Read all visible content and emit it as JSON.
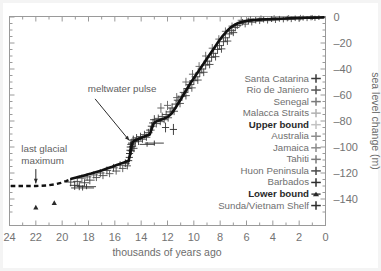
{
  "chart_data": {
    "type": "scatter",
    "title": "",
    "subtitle": "",
    "xlabel": "thousands of years ago",
    "ylabel": "sea level change (m)",
    "xlim": [
      24,
      0
    ],
    "ylim": [
      -150,
      4
    ],
    "x_ticks": [
      24,
      22,
      20,
      18,
      16,
      14,
      12,
      10,
      8,
      6,
      4,
      2,
      0
    ],
    "x_tick_labels": [
      "24",
      "22",
      "20",
      "18",
      "16",
      "14",
      "12",
      "10",
      "8",
      "6",
      "4",
      "2",
      "0"
    ],
    "x_minor_step": 1,
    "y_ticks": [
      0,
      -20,
      -40,
      -60,
      -80,
      -100,
      -120,
      -140
    ],
    "y_tick_labels": [
      "0",
      "-20",
      "-40",
      "-60",
      "-80",
      "-100",
      "-120",
      "-140"
    ],
    "y_minor_step": 5,
    "grid": false,
    "legend_position": "center-right",
    "legend": [
      {
        "label": "Santa Catarina",
        "marker": "plus",
        "color": "#3a3a3a",
        "bold": false
      },
      {
        "label": "Rio de Janiero",
        "marker": "plus",
        "color": "#555555",
        "bold": false
      },
      {
        "label": "Senegal",
        "marker": "plus",
        "color": "#7a7a7a",
        "bold": false
      },
      {
        "label": "Malacca Straits",
        "marker": "plus",
        "color": "#b0b0b0",
        "bold": false
      },
      {
        "label": "Upper bound",
        "marker": "plus",
        "color": "#c2c2c2",
        "bold": true
      },
      {
        "label": "Australia",
        "marker": "plus",
        "color": "#8c8c8c",
        "bold": false
      },
      {
        "label": "Jamaica",
        "marker": "plus",
        "color": "#8c8c8c",
        "bold": false
      },
      {
        "label": "Tahiti",
        "marker": "plus",
        "color": "#7a7a7a",
        "bold": false
      },
      {
        "label": "Huon Peninsula",
        "marker": "plus",
        "color": "#4a4a4a",
        "bold": false
      },
      {
        "label": "Barbados",
        "marker": "plus",
        "color": "#2e2e2e",
        "bold": false
      },
      {
        "label": "Lower bound",
        "marker": "triangle",
        "color": "#2a2a2a",
        "bold": true
      },
      {
        "label": "Sunda/Vietnam Shelf",
        "marker": "plus",
        "color": "#2e2e2e",
        "bold": false
      }
    ],
    "annotations": [
      {
        "text": "meltwater pulse",
        "text_x": 18.05,
        "text_y": -58,
        "anchor": "start",
        "arrow_from_x": 17.5,
        "arrow_from_y": -63,
        "arrow_to_x": 14.9,
        "arrow_to_y": -95
      },
      {
        "text_lines": [
          "last glacial",
          "maximum"
        ],
        "text_x": 23.1,
        "text_y": -104,
        "anchor": "start",
        "arrow_from_x": 22.0,
        "arrow_from_y": -117,
        "arrow_to_x": 22.0,
        "arrow_to_y": -128
      }
    ],
    "series": [
      {
        "name": "Mean sea level curve (solid)",
        "style": "solid-line",
        "points": [
          [
            19.3,
            -124.5
          ],
          [
            19.0,
            -123.6
          ],
          [
            18.6,
            -122.6
          ],
          [
            18.2,
            -121.5
          ],
          [
            17.8,
            -120.4
          ],
          [
            17.4,
            -119.2
          ],
          [
            17.0,
            -118.0
          ],
          [
            16.6,
            -116.6
          ],
          [
            16.2,
            -115.2
          ],
          [
            15.8,
            -113.6
          ],
          [
            15.4,
            -112.2
          ],
          [
            15.1,
            -111.2
          ],
          [
            14.95,
            -110.6
          ],
          [
            14.85,
            -106.0
          ],
          [
            14.75,
            -100.0
          ],
          [
            14.65,
            -96.5
          ],
          [
            14.5,
            -95.0
          ],
          [
            14.2,
            -93.8
          ],
          [
            13.9,
            -92.5
          ],
          [
            13.6,
            -91.3
          ],
          [
            13.35,
            -90.4
          ],
          [
            13.2,
            -86.0
          ],
          [
            13.05,
            -82.0
          ],
          [
            12.9,
            -80.5
          ],
          [
            12.6,
            -79.4
          ],
          [
            12.3,
            -78.3
          ],
          [
            12.0,
            -77.0
          ],
          [
            11.7,
            -74.5
          ],
          [
            11.4,
            -70.0
          ],
          [
            11.1,
            -65.0
          ],
          [
            10.8,
            -60.0
          ],
          [
            10.5,
            -55.0
          ],
          [
            10.2,
            -50.0
          ],
          [
            9.9,
            -45.5
          ],
          [
            9.6,
            -41.0
          ],
          [
            9.3,
            -36.5
          ],
          [
            9.0,
            -32.0
          ],
          [
            8.7,
            -27.5
          ],
          [
            8.4,
            -23.0
          ],
          [
            8.1,
            -18.5
          ],
          [
            7.8,
            -14.5
          ],
          [
            7.5,
            -11.0
          ],
          [
            7.2,
            -8.0
          ],
          [
            6.9,
            -6.0
          ],
          [
            6.6,
            -4.6
          ],
          [
            6.3,
            -3.6
          ],
          [
            6.0,
            -3.0
          ],
          [
            5.5,
            -2.4
          ],
          [
            5.0,
            -2.0
          ],
          [
            4.5,
            -1.7
          ],
          [
            4.0,
            -1.5
          ],
          [
            3.5,
            -1.3
          ],
          [
            3.0,
            -1.1
          ],
          [
            2.5,
            -0.9
          ],
          [
            2.0,
            -0.8
          ],
          [
            1.5,
            -0.6
          ],
          [
            1.0,
            -0.5
          ],
          [
            0.5,
            -0.4
          ],
          [
            0.15,
            -0.3
          ]
        ]
      },
      {
        "name": "Inferred LGM plateau (dashed)",
        "style": "dashed-line",
        "points": [
          [
            23.9,
            -130.0
          ],
          [
            23.0,
            -130.0
          ],
          [
            22.0,
            -130.0
          ],
          [
            21.2,
            -129.6
          ],
          [
            20.6,
            -128.8
          ],
          [
            20.1,
            -127.6
          ],
          [
            19.7,
            -126.2
          ],
          [
            19.3,
            -124.5
          ]
        ]
      }
    ],
    "scatter_groups": [
      {
        "name": "dense-core-samples",
        "marker": "plus-errorbar",
        "note": "coral and shelf core sea-level index points with horizontal and vertical error bars"
      }
    ],
    "data_points": [
      [
        19.35,
        -127.0,
        0.45,
        4.0,
        "#3a3a3a"
      ],
      [
        19.05,
        -129.5,
        0.5,
        4.5,
        "#2e2e2e"
      ],
      [
        18.85,
        -126.5,
        0.4,
        3.5,
        "#444444"
      ],
      [
        18.7,
        -130.0,
        0.55,
        4.0,
        "#2e2e2e"
      ],
      [
        18.5,
        -124.0,
        0.35,
        3.5,
        "#555555"
      ],
      [
        18.3,
        -127.5,
        0.45,
        3.0,
        "#3a3a3a"
      ],
      [
        18.1,
        -123.0,
        0.4,
        3.5,
        "#4a4a4a"
      ],
      [
        17.9,
        -125.5,
        0.5,
        4.0,
        "#3a3a3a"
      ],
      [
        17.6,
        -121.5,
        0.4,
        3.2,
        "#555555"
      ],
      [
        17.4,
        -123.5,
        0.35,
        3.0,
        "#4a4a4a"
      ],
      [
        17.1,
        -120.0,
        0.4,
        3.5,
        "#3f3f3f"
      ],
      [
        16.9,
        -122.0,
        0.45,
        3.0,
        "#4a4a4a"
      ],
      [
        16.6,
        -118.0,
        0.4,
        3.5,
        "#3a3a3a"
      ],
      [
        16.4,
        -120.5,
        0.35,
        3.0,
        "#555555"
      ],
      [
        16.1,
        -116.0,
        0.4,
        3.5,
        "#3f3f3f"
      ],
      [
        15.9,
        -118.5,
        0.4,
        3.0,
        "#4a4a4a"
      ],
      [
        15.6,
        -114.0,
        0.4,
        3.5,
        "#3a3a3a"
      ],
      [
        15.4,
        -116.5,
        0.35,
        3.2,
        "#4f4f4f"
      ],
      [
        15.2,
        -112.5,
        0.4,
        3.5,
        "#333333"
      ],
      [
        15.05,
        -114.5,
        0.3,
        3.0,
        "#3a3a3a"
      ],
      [
        14.95,
        -110.5,
        0.3,
        4.0,
        "#222222"
      ],
      [
        14.9,
        -108.0,
        0.3,
        4.5,
        "#222222"
      ],
      [
        14.88,
        -105.0,
        0.3,
        4.0,
        "#262626"
      ],
      [
        14.85,
        -102.5,
        0.3,
        4.5,
        "#222222"
      ],
      [
        14.8,
        -100.0,
        0.35,
        5.0,
        "#1f1f1f"
      ],
      [
        14.78,
        -98.0,
        0.3,
        4.0,
        "#262626"
      ],
      [
        14.75,
        -103.0,
        0.3,
        4.0,
        "#2a2a2a"
      ],
      [
        14.7,
        -97.0,
        0.35,
        4.5,
        "#222222"
      ],
      [
        14.65,
        -99.5,
        0.3,
        4.0,
        "#2e2e2e"
      ],
      [
        14.6,
        -94.5,
        0.35,
        4.0,
        "#2a2a2a"
      ],
      [
        14.55,
        -101.0,
        0.3,
        3.5,
        "#333333"
      ],
      [
        14.45,
        -96.0,
        0.35,
        4.0,
        "#2e2e2e"
      ],
      [
        14.35,
        -93.0,
        0.4,
        3.5,
        "#3a3a3a"
      ],
      [
        14.2,
        -95.5,
        0.35,
        3.5,
        "#333333"
      ],
      [
        14.05,
        -92.0,
        0.4,
        3.5,
        "#3f3f3f"
      ],
      [
        13.9,
        -94.0,
        0.35,
        3.0,
        "#3a3a3a"
      ],
      [
        13.75,
        -90.5,
        0.4,
        3.5,
        "#444444"
      ],
      [
        13.6,
        -92.5,
        0.35,
        3.0,
        "#3f3f3f"
      ],
      [
        13.45,
        -89.0,
        0.4,
        3.5,
        "#3a3a3a"
      ],
      [
        13.3,
        -87.0,
        0.4,
        4.0,
        "#333333"
      ],
      [
        13.2,
        -84.0,
        0.35,
        4.0,
        "#2e2e2e"
      ],
      [
        13.1,
        -81.5,
        0.35,
        4.0,
        "#333333"
      ],
      [
        13.0,
        -79.0,
        0.4,
        4.5,
        "#2e2e2e"
      ],
      [
        12.85,
        -82.0,
        0.4,
        3.5,
        "#3a3a3a"
      ],
      [
        12.7,
        -78.0,
        0.4,
        3.5,
        "#444444"
      ],
      [
        12.55,
        -80.5,
        0.35,
        3.0,
        "#3f3f3f"
      ],
      [
        12.4,
        -76.5,
        0.4,
        3.5,
        "#4a4a4a"
      ],
      [
        12.25,
        -79.0,
        0.35,
        3.0,
        "#444444"
      ],
      [
        12.1,
        -75.0,
        0.4,
        3.5,
        "#3f3f3f"
      ],
      [
        11.95,
        -77.5,
        0.35,
        3.5,
        "#4a4a4a"
      ],
      [
        11.8,
        -73.0,
        0.4,
        4.0,
        "#3a3a3a"
      ],
      [
        11.65,
        -70.0,
        0.4,
        4.5,
        "#333333"
      ],
      [
        11.5,
        -72.5,
        0.35,
        3.5,
        "#3f3f3f"
      ],
      [
        11.35,
        -67.0,
        0.4,
        4.0,
        "#3a3a3a"
      ],
      [
        11.2,
        -64.0,
        0.4,
        4.5,
        "#333333"
      ],
      [
        11.05,
        -66.5,
        0.35,
        3.5,
        "#444444"
      ],
      [
        10.9,
        -61.0,
        0.4,
        4.0,
        "#3a3a3a"
      ],
      [
        10.75,
        -58.0,
        0.4,
        4.0,
        "#3f3f3f"
      ],
      [
        10.6,
        -60.5,
        0.35,
        3.5,
        "#444444"
      ],
      [
        10.45,
        -55.0,
        0.4,
        4.0,
        "#3a3a3a"
      ],
      [
        10.3,
        -52.0,
        0.4,
        4.0,
        "#3f3f3f"
      ],
      [
        10.15,
        -54.5,
        0.35,
        3.5,
        "#4a4a4a"
      ],
      [
        10.0,
        -49.0,
        0.4,
        4.0,
        "#3a3a3a"
      ],
      [
        9.85,
        -46.0,
        0.4,
        4.0,
        "#444444"
      ],
      [
        9.7,
        -48.5,
        0.35,
        3.5,
        "#3f3f3f"
      ],
      [
        9.55,
        -43.0,
        0.4,
        4.0,
        "#3a3a3a"
      ],
      [
        9.4,
        -40.0,
        0.4,
        4.0,
        "#444444"
      ],
      [
        9.25,
        -42.5,
        0.35,
        3.5,
        "#3f3f3f"
      ],
      [
        9.1,
        -37.0,
        0.4,
        4.0,
        "#3a3a3a"
      ],
      [
        8.95,
        -34.0,
        0.4,
        4.0,
        "#444444"
      ],
      [
        8.8,
        -36.5,
        0.35,
        3.5,
        "#3f3f3f"
      ],
      [
        8.65,
        -31.0,
        0.4,
        4.0,
        "#3a3a3a"
      ],
      [
        8.5,
        -28.0,
        0.4,
        4.0,
        "#444444"
      ],
      [
        8.35,
        -30.5,
        0.35,
        3.5,
        "#3f3f3f"
      ],
      [
        8.2,
        -25.0,
        0.4,
        4.0,
        "#3a3a3a"
      ],
      [
        8.05,
        -22.0,
        0.4,
        4.0,
        "#444444"
      ],
      [
        7.9,
        -24.5,
        0.35,
        3.5,
        "#3f3f3f"
      ],
      [
        7.75,
        -19.0,
        0.4,
        4.0,
        "#3a3a3a"
      ],
      [
        7.6,
        -16.0,
        0.4,
        4.0,
        "#444444"
      ],
      [
        7.45,
        -18.5,
        0.35,
        3.5,
        "#3f3f3f"
      ],
      [
        7.3,
        -13.0,
        0.4,
        3.5,
        "#3a3a3a"
      ],
      [
        7.15,
        -10.5,
        0.4,
        3.5,
        "#444444"
      ],
      [
        7.0,
        -12.0,
        0.35,
        3.0,
        "#3f3f3f"
      ],
      [
        6.85,
        -8.0,
        0.4,
        3.5,
        "#3a3a3a"
      ],
      [
        6.7,
        -6.5,
        0.4,
        3.0,
        "#444444"
      ],
      [
        6.5,
        -5.0,
        0.4,
        3.0,
        "#3f3f3f"
      ],
      [
        6.3,
        -4.0,
        0.4,
        2.5,
        "#3a3a3a"
      ],
      [
        6.1,
        -5.5,
        0.35,
        2.5,
        "#4a4a4a"
      ],
      [
        5.85,
        -3.0,
        0.4,
        2.5,
        "#3f3f3f"
      ],
      [
        5.6,
        -4.0,
        0.4,
        2.5,
        "#444444"
      ],
      [
        5.3,
        -2.5,
        0.4,
        2.5,
        "#3a3a3a"
      ],
      [
        5.0,
        -3.2,
        0.4,
        2.0,
        "#4a4a4a"
      ],
      [
        4.7,
        -2.0,
        0.4,
        2.0,
        "#3f3f3f"
      ],
      [
        4.4,
        -2.8,
        0.4,
        2.0,
        "#444444"
      ],
      [
        4.1,
        -1.6,
        0.4,
        2.0,
        "#3a3a3a"
      ],
      [
        3.8,
        -2.4,
        0.4,
        2.0,
        "#4a4a4a"
      ],
      [
        3.5,
        -1.4,
        0.4,
        2.0,
        "#3f3f3f"
      ],
      [
        3.2,
        -2.0,
        0.4,
        1.8,
        "#444444"
      ],
      [
        2.9,
        -1.2,
        0.4,
        1.8,
        "#3a3a3a"
      ],
      [
        2.6,
        -1.8,
        0.4,
        1.8,
        "#4a4a4a"
      ],
      [
        2.3,
        -1.0,
        0.4,
        1.8,
        "#3f3f3f"
      ],
      [
        2.0,
        -1.5,
        0.4,
        1.8,
        "#444444"
      ],
      [
        1.7,
        -0.8,
        0.4,
        1.5,
        "#3a3a3a"
      ],
      [
        1.4,
        -1.2,
        0.4,
        1.5,
        "#4a4a4a"
      ],
      [
        1.1,
        -0.6,
        0.4,
        1.5,
        "#3f3f3f"
      ],
      [
        0.8,
        -1.0,
        0.4,
        1.5,
        "#444444"
      ],
      [
        0.5,
        -0.5,
        0.4,
        1.2,
        "#3a3a3a"
      ],
      [
        13.0,
        -97.0,
        1.2,
        1.5,
        "#2a2a2a"
      ],
      [
        13.55,
        -98.0,
        0.9,
        1.2,
        "#333333"
      ],
      [
        11.55,
        -86.5,
        0.3,
        6.0,
        "#2a2a2a"
      ],
      [
        12.15,
        -85.0,
        0.3,
        5.0,
        "#333333"
      ],
      [
        18.45,
        -131.5,
        1.5,
        1.5,
        "#2e2e2e"
      ],
      [
        18.15,
        -130.5,
        1.2,
        1.5,
        "#333333"
      ],
      [
        12.5,
        -70.0,
        0.3,
        5.0,
        "#555555"
      ],
      [
        12.0,
        -68.0,
        0.3,
        4.5,
        "#5f5f5f"
      ],
      [
        11.3,
        -62.0,
        0.3,
        4.5,
        "#5a5a5a"
      ],
      [
        10.6,
        -50.0,
        0.3,
        4.0,
        "#606060"
      ],
      [
        10.1,
        -44.0,
        0.3,
        4.0,
        "#5a5a5a"
      ],
      [
        9.6,
        -38.0,
        0.3,
        4.0,
        "#606060"
      ],
      [
        9.1,
        -30.0,
        0.3,
        4.0,
        "#5a5a5a"
      ],
      [
        8.6,
        -24.0,
        0.3,
        4.0,
        "#606060"
      ],
      [
        8.1,
        -17.0,
        0.3,
        3.5,
        "#5a5a5a"
      ],
      [
        7.6,
        -11.0,
        0.3,
        3.5,
        "#606060"
      ],
      [
        7.1,
        -7.0,
        0.3,
        3.0,
        "#5a5a5a"
      ],
      [
        6.4,
        -2.5,
        0.3,
        2.5,
        "#606060"
      ],
      [
        5.7,
        -1.5,
        0.3,
        2.0,
        "#6a6a6a"
      ],
      [
        4.9,
        -1.0,
        0.3,
        2.0,
        "#6a6a6a"
      ],
      [
        3.9,
        -0.8,
        0.3,
        2.0,
        "#6a6a6a"
      ],
      [
        2.8,
        -0.6,
        0.3,
        1.8,
        "#6a6a6a"
      ],
      [
        1.9,
        -0.5,
        0.3,
        1.8,
        "#6a6a6a"
      ],
      [
        1.0,
        -0.4,
        0.3,
        1.5,
        "#6a6a6a"
      ]
    ],
    "lower_bound_triangles": [
      [
        22.0,
        -146.5
      ],
      [
        20.6,
        -143.0
      ]
    ]
  }
}
